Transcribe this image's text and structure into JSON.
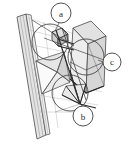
{
  "figure": {
    "background_color": "#ffffff",
    "stroke_color": "#3a3a3a",
    "light_stroke_color": "#9a9a9a",
    "fill_light": "#e8e8e8",
    "fill_mid": "#d8d8d8",
    "fill_dark": "#c4c4c4",
    "callouts": [
      {
        "id": "a",
        "label": "a",
        "cx": 61,
        "cy": 13,
        "r": 10
      },
      {
        "id": "b",
        "label": "b",
        "cx": 83,
        "cy": 116,
        "r": 10
      },
      {
        "id": "c",
        "label": "c",
        "cx": 112,
        "cy": 62,
        "r": 9
      }
    ],
    "construction_circles": [
      {
        "id": "circle-upper-left",
        "cx": 50,
        "cy": 42,
        "r": 18
      },
      {
        "id": "circle-middle-right",
        "cx": 86,
        "cy": 57,
        "r": 18
      },
      {
        "id": "circle-lower-middle",
        "cx": 70,
        "cy": 93,
        "r": 18
      }
    ],
    "parts": {
      "wall_strip": "wall-strip",
      "box": "box-solid",
      "pyramid": "pyramid-funnel",
      "upper_wedge": "upper-wedge"
    }
  }
}
